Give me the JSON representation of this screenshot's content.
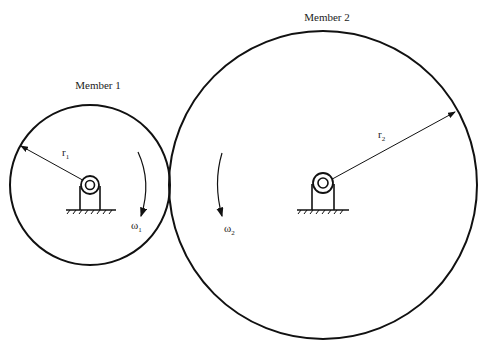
{
  "diagram": {
    "members": [
      {
        "title": "Member 1",
        "radius_label": "r",
        "radius_sub": "1",
        "omega_label": "ω",
        "omega_sub": "1"
      },
      {
        "title": "Member 2",
        "radius_label": "r",
        "radius_sub": "2",
        "omega_label": "ω",
        "omega_sub": "2"
      }
    ],
    "colors": {
      "stroke": "#111111",
      "background": "#ffffff"
    }
  }
}
